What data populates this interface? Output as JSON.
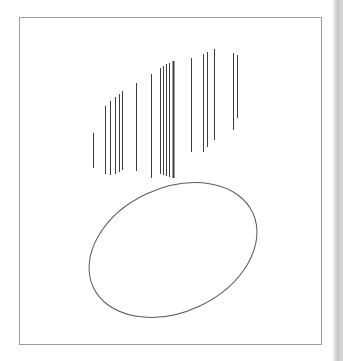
{
  "scene": {
    "canvas": {
      "width": 343,
      "height": 361,
      "background": "#ffffff"
    },
    "frame": {
      "x": 19,
      "y": 17,
      "width": 303,
      "height": 328,
      "border_color": "#9d9d9d",
      "fill": "#ffffff"
    },
    "scrollbar": {
      "x": 333,
      "width": 10,
      "height": 361,
      "edge_color": "#ededed",
      "main_color": "#c9c9c9",
      "right_color": "#d6d6d6"
    },
    "segments": {
      "stroke": "#3d3d3d",
      "points": [
        {
          "x": 93,
          "y1": 133,
          "y2": 168,
          "w": 1
        },
        {
          "x": 105,
          "y1": 106,
          "y2": 174,
          "w": 1
        },
        {
          "x": 110,
          "y1": 101,
          "y2": 175,
          "w": 1
        },
        {
          "x": 115,
          "y1": 97,
          "y2": 174,
          "w": 1
        },
        {
          "x": 119,
          "y1": 94,
          "y2": 172,
          "w": 1
        },
        {
          "x": 122,
          "y1": 91,
          "y2": 170,
          "w": 1
        },
        {
          "x": 136,
          "y1": 83,
          "y2": 171,
          "w": 1
        },
        {
          "x": 151,
          "y1": 74,
          "y2": 178,
          "w": 1
        },
        {
          "x": 160,
          "y1": 68,
          "y2": 174,
          "w": 1
        },
        {
          "x": 163,
          "y1": 66,
          "y2": 175,
          "w": 1
        },
        {
          "x": 166,
          "y1": 64,
          "y2": 176,
          "w": 1
        },
        {
          "x": 169,
          "y1": 63,
          "y2": 177,
          "w": 1
        },
        {
          "x": 173,
          "y1": 61,
          "y2": 178,
          "w": 2
        },
        {
          "x": 191,
          "y1": 58,
          "y2": 152,
          "w": 1
        },
        {
          "x": 203,
          "y1": 54,
          "y2": 152,
          "w": 1
        },
        {
          "x": 207,
          "y1": 52,
          "y2": 147,
          "w": 1
        },
        {
          "x": 214,
          "y1": 49,
          "y2": 140,
          "w": 1
        },
        {
          "x": 233,
          "y1": 53,
          "y2": 130,
          "w": 1
        },
        {
          "x": 237,
          "y1": 55,
          "y2": 118,
          "w": 1
        }
      ]
    },
    "ellipse": {
      "cx": 173,
      "cy": 250,
      "rx": 88,
      "ry": 62,
      "rotation": -25,
      "stroke": "#5a5a5a",
      "stroke_width": 1,
      "fill": "none"
    }
  }
}
